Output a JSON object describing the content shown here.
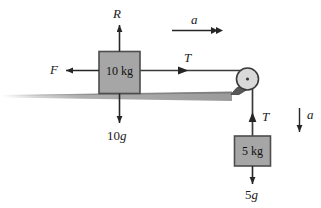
{
  "figure": {
    "type": "free-body-diagram"
  },
  "blocks": {
    "block_on_table": {
      "label": "10 kg",
      "mass_value": "10",
      "mass_unit": "kg",
      "fill_color": "#a6a6a6",
      "stroke_color": "#4d4d4d"
    },
    "hanging_block": {
      "label": "5 kg",
      "mass_value": "5",
      "mass_unit": "kg",
      "fill_color": "#a6a6a6",
      "stroke_color": "#4d4d4d"
    }
  },
  "pulley": {
    "name": "pulley",
    "fill_color": "#d9d9d9",
    "stroke_color": "#3a3a3a",
    "bracket_color": "#595959"
  },
  "surface": {
    "name": "ground-surface",
    "color": "#9e9e9e"
  },
  "labels": {
    "normal_force": "R",
    "friction_force": "F",
    "tension_top": "T",
    "tension_right": "T",
    "weight_block": "10",
    "weight_block_g": "g",
    "weight_hanging": "5",
    "weight_hanging_g": "g",
    "acceleration_top": "a",
    "acceleration_right": "a"
  },
  "colors": {
    "arrow": "#262626",
    "text": "#1a1a1a",
    "background": "#ffffff"
  }
}
